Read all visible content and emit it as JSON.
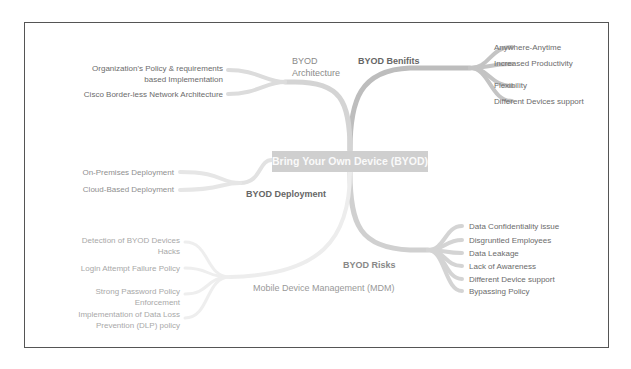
{
  "center": {
    "label": "Bring Your Own Device (BYOD)"
  },
  "branches": {
    "architecture": {
      "label": "BYOD\nArchitecture",
      "label_line1": "BYOD",
      "label_line2": "Architecture",
      "children": [
        {
          "line1": "Organization's Policy & requirements",
          "line2": "based Implementation"
        },
        {
          "line1": "Cisco Border-less Network Architecture"
        }
      ]
    },
    "benefits": {
      "label": "BYOD Benifits",
      "children": [
        "Anywhere-Anytime",
        "Increased Productivity",
        "Flexibility",
        "Different Devices support"
      ]
    },
    "deployment": {
      "label": "BYOD Deployment",
      "children": [
        "On-Premises Deployment",
        "Cloud-Based Deployment"
      ]
    },
    "risks": {
      "label": "BYOD Risks",
      "children": [
        "Data Confidentiality issue",
        "Disgruntled Employees",
        "Data Leakage",
        "Lack of Awareness",
        "Different Device support",
        "Bypassing Policy"
      ]
    },
    "mdm": {
      "label": "Mobile Device Management (MDM)",
      "children": [
        {
          "line1": "Detection of BYOD Devices",
          "line2": "Hacks"
        },
        {
          "line1": "Login Attempt Failure Policy"
        },
        {
          "line1": "Strong Password Policy",
          "line2": "Enforcement"
        },
        {
          "line1": "Implementation of Data Loss",
          "line2": "Prevention (DLP) policy"
        }
      ]
    }
  },
  "colors": {
    "frame": "#555555",
    "link_dark": "#b8b8b8",
    "link_light": "#e6e6e6",
    "center_bg": "#cfcfcf",
    "text": "#6b6b6b"
  }
}
